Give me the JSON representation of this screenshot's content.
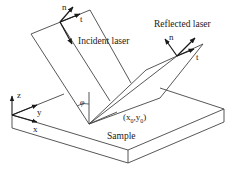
{
  "figure": {
    "type": "schematic",
    "title": "",
    "labels": {
      "incident": "Incident laser",
      "reflected": "Reflected laser",
      "sample": "Sample",
      "angle": "φ",
      "point_x": "(x",
      "point_x_sub": "0",
      "point_sep": ",y",
      "point_y_sub": "0",
      "point_close": ")",
      "incident_n": "n",
      "incident_t": "t",
      "reflected_n": "n",
      "reflected_t": "t",
      "axis_x": "x",
      "axis_y": "y",
      "axis_z": "z"
    },
    "colors": {
      "line": "#333333",
      "text": "#1a1a1a",
      "background": "#ffffff"
    }
  }
}
